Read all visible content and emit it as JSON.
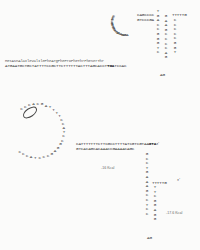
{
  "figure": {
    "top_structure": {
      "amino_acid_line": "MetAsnAlaIleValIlePheArgPheProPheThrPheSerThr",
      "dna_line_prefix": "ATGAATGCTGCTATTTTCCGCTTCTTTTTTACTTTAGCACCT",
      "stop_codon": "TGA",
      "dna_line_suffix": "TCCAC",
      "loop_sequence": "CCCACCAAAGGGACGAGCAGAGCA",
      "stem_top_rows": [
        "CAGCCCC",
        "GTCCCGA"
      ],
      "hairpin_left_column": "TGACCGGGTC",
      "hairpin_right_column": "GAAGCCCCAG",
      "tail": "TTTTTG",
      "loop_bottom": "AG"
    },
    "bottom_structure": {
      "loop_sequence": "CCCACGATTTTCCATCCGGAGCCCTACCC",
      "boxed_label": "SD",
      "top_strand": "CATTTTTTTCTTCGCCTTTTATCGTCGTAA",
      "start_codon": "GTA",
      "bottom_strand": "GTCACAGCACAAACCGAAAACAGC",
      "stem_left": [
        "G",
        "C",
        "C",
        "T",
        "G",
        "A",
        "A",
        "A",
        "G",
        "C",
        "C",
        "T",
        "C",
        "C"
      ],
      "stem_right": [
        "T",
        "T",
        "C",
        "G",
        "G",
        "A",
        "G",
        "G"
      ],
      "tail": "TTTTTG",
      "loop_bottom": "AG",
      "annotation_1": "-16 Kcal",
      "annotation_2": "-17.6 Kcal",
      "superscript_3prime_a": "3'",
      "superscript_3prime_b": "3'"
    }
  }
}
